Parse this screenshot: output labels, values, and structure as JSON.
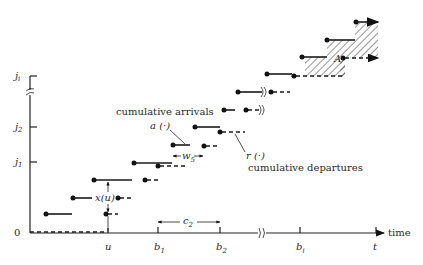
{
  "diagram": {
    "y_axis": {
      "labels": [
        {
          "text": "0",
          "sub": ""
        },
        {
          "text": "j",
          "sub": "1"
        },
        {
          "text": "j",
          "sub": "2"
        },
        {
          "text": "j",
          "sub": "i"
        }
      ]
    },
    "x_axis": {
      "label": "time",
      "ticks": [
        {
          "text": "u",
          "sub": ""
        },
        {
          "text": "b",
          "sub": "1"
        },
        {
          "text": "b",
          "sub": "2"
        },
        {
          "text": "b",
          "sub": "i"
        },
        {
          "text": "t",
          "sub": ""
        }
      ]
    },
    "annotations": {
      "cumulative_arrivals": "cumulative arrivals",
      "arrivals_fn": "a (·)",
      "departures_fn": "r (·)",
      "cumulative_departures": "cumulative departures",
      "queue_length": "x(u)",
      "wait_label": "w",
      "wait_sub": "5",
      "cycle_label": "c",
      "cycle_sub": "2",
      "area_label": "A"
    },
    "colors": {
      "ink": "#1a1a1a",
      "background": "#ffffff"
    }
  }
}
